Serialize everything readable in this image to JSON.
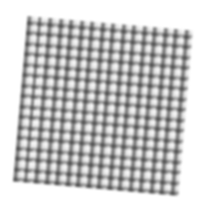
{
  "image": {
    "subject": "gingham fabric swatch",
    "description": "Black and white checkered gingham cloth square, slightly rotated, on white background",
    "colors": {
      "background": "#ffffff",
      "light_check": "#f4f4f4",
      "dark_check": "#282828",
      "mid_check": "#787878"
    },
    "rotation_deg": 5,
    "pattern_period_px": 10.5
  }
}
